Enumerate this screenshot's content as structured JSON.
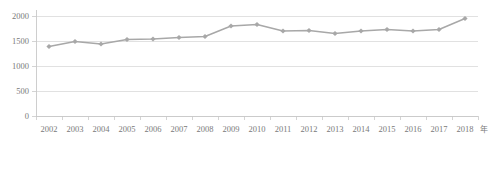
{
  "chart_data": {
    "type": "line",
    "title": "",
    "subtitle": "",
    "xlabel": "年",
    "ylabel": "",
    "categories": [
      "2002",
      "2003",
      "2004",
      "2005",
      "2006",
      "2007",
      "2008",
      "2009",
      "2010",
      "2011",
      "2012",
      "2013",
      "2014",
      "2015",
      "2016",
      "2017",
      "2018"
    ],
    "values": [
      1390,
      1490,
      1440,
      1530,
      1540,
      1570,
      1590,
      1800,
      1830,
      1700,
      1710,
      1650,
      1700,
      1730,
      1700,
      1730,
      1950
    ],
    "series": [
      {
        "name": "",
        "values": [
          1390,
          1490,
          1440,
          1530,
          1540,
          1570,
          1590,
          1800,
          1830,
          1700,
          1710,
          1650,
          1700,
          1730,
          1700,
          1730,
          1950
        ]
      }
    ],
    "x_tick_labels": [
      "2002",
      "2003",
      "2004",
      "2005",
      "2006",
      "2007",
      "2008",
      "2009",
      "2010",
      "2011",
      "2012",
      "2013",
      "2014",
      "2015",
      "2016",
      "2017",
      "2018"
    ],
    "y_tick_labels": [
      "0",
      "500",
      "1000",
      "1500",
      "2000"
    ],
    "y_ticks": [
      0,
      500,
      1000,
      1500,
      2000
    ],
    "ylim": [
      0,
      2000
    ],
    "grid": "horizontal",
    "legend": "none",
    "colors": {
      "series": "#a8a8a8",
      "grid": "#d9d9d9",
      "axis": "#c9c9c9",
      "tick_text": "#7a7a7a",
      "background": "#ffffff"
    },
    "annotations": []
  }
}
